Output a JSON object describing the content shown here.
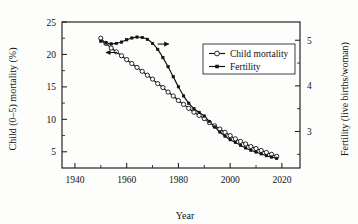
{
  "chart_data": {
    "type": "line",
    "title": "",
    "xlabel": "Year",
    "ylabel": "Child (0–5) mortality (%)",
    "y2label": "Fertility (live births/woman)",
    "xlim": [
      1935,
      2027
    ],
    "ylim": [
      2.5,
      25
    ],
    "y2lim": [
      2.2,
      5.4
    ],
    "xticks": [
      1940,
      1960,
      1980,
      2000,
      2020
    ],
    "yticks": [
      5,
      10,
      15,
      20,
      25
    ],
    "y2ticks": [
      3,
      4,
      5
    ],
    "y_minor_ticks": [
      7.5,
      12.5,
      17.5,
      22.5
    ],
    "y2_minor_ticks": [
      2.5,
      3.5,
      4.5
    ],
    "grid": false,
    "legend_position": "top-right",
    "annotations": [
      {
        "name": "left-axis-arrow",
        "text": "←",
        "points_to": "left-axis",
        "x": 1952,
        "y": 20.3
      },
      {
        "name": "right-axis-arrow",
        "text": "→",
        "points_to": "right-axis",
        "x": 1972,
        "y": 21.6
      }
    ],
    "series": [
      {
        "name": "Child mortality",
        "axis": "left",
        "marker": "open-circle",
        "unit": "%",
        "x": [
          1950,
          1952,
          1954,
          1956,
          1958,
          1960,
          1962,
          1964,
          1966,
          1968,
          1970,
          1972,
          1974,
          1976,
          1978,
          1980,
          1982,
          1984,
          1986,
          1988,
          1990,
          1992,
          1994,
          1996,
          1998,
          2000,
          2002,
          2004,
          2006,
          2008,
          2010,
          2012,
          2014,
          2016,
          2018
        ],
        "values": [
          22.5,
          21.7,
          21.0,
          20.4,
          19.8,
          19.2,
          18.6,
          18.0,
          17.4,
          16.8,
          16.2,
          15.5,
          14.9,
          14.2,
          13.6,
          12.9,
          12.3,
          11.7,
          11.1,
          10.6,
          10.1,
          9.5,
          9.0,
          8.5,
          8.0,
          7.5,
          7.0,
          6.6,
          6.2,
          5.8,
          5.5,
          5.2,
          4.9,
          4.6,
          4.3
        ]
      },
      {
        "name": "Fertility",
        "axis": "right",
        "marker": "filled-cross",
        "unit": "live births/woman",
        "x": [
          1950,
          1952,
          1954,
          1956,
          1958,
          1960,
          1962,
          1964,
          1966,
          1968,
          1970,
          1972,
          1974,
          1976,
          1978,
          1980,
          1982,
          1984,
          1986,
          1988,
          1990,
          1992,
          1994,
          1996,
          1998,
          2000,
          2002,
          2004,
          2006,
          2008,
          2010,
          2012,
          2014,
          2016,
          2018
        ],
        "values": [
          4.98,
          4.94,
          4.92,
          4.93,
          4.96,
          5.01,
          5.05,
          5.07,
          5.06,
          5.02,
          4.93,
          4.8,
          4.62,
          4.42,
          4.2,
          3.98,
          3.78,
          3.62,
          3.5,
          3.42,
          3.34,
          3.22,
          3.1,
          2.99,
          2.9,
          2.82,
          2.76,
          2.7,
          2.64,
          2.59,
          2.55,
          2.51,
          2.47,
          2.44,
          2.41
        ]
      }
    ],
    "legend_entries": [
      {
        "label": "Child mortality",
        "marker": "open-circle"
      },
      {
        "label": "Fertility",
        "marker": "filled-cross"
      }
    ]
  }
}
